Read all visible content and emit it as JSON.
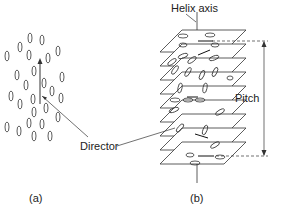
{
  "labels": {
    "helix_axis": "Helix axis",
    "director": "Director",
    "pitch": "Pitch",
    "panel_a": "(a)",
    "panel_b": "(b)"
  },
  "colors": {
    "stroke": "#333333",
    "background": "#ffffff"
  },
  "panel_a": {
    "description": "Nematic phase: elongated molecules aligned along a common director",
    "molecule_count": 30
  },
  "panel_b": {
    "description": "Cholesteric phase: stacked layers with director rotating about the helix axis",
    "layer_count": 9
  }
}
